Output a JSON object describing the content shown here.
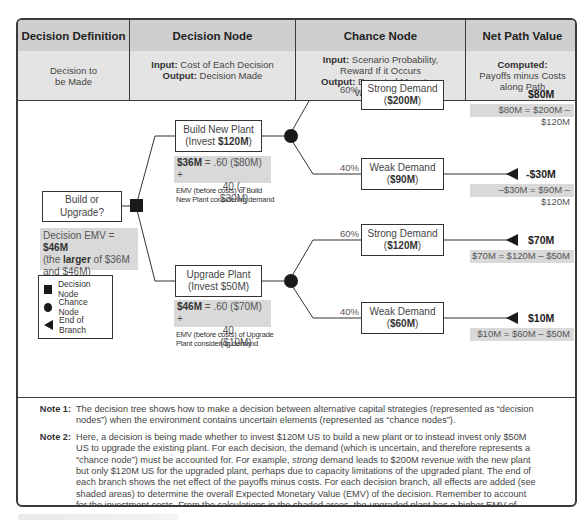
{
  "header": {
    "columns": [
      {
        "title": "Decision Definition",
        "desc_line1": "Decision to",
        "desc_line2": "be Made"
      },
      {
        "title": "Decision Node",
        "input_label": "Input:",
        "input_text": " Cost of Each Decision",
        "output_label": "Output:",
        "output_text": " Decision Made"
      },
      {
        "title": "Chance Node",
        "input_label": "Input:",
        "input_text": " Scenario Probability,",
        "input_text2": "Reward If it Occurs",
        "output_label": "Output:",
        "output_text": " Expected Monetary",
        "output_text2": "Value (EMV)"
      },
      {
        "title": "Net Path Value",
        "computed_label": "Computed:",
        "computed_text1": "Payoffs minus Costs",
        "computed_text2": "along Path"
      }
    ]
  },
  "tree": {
    "root": {
      "label": "Build or Upgrade?",
      "emv_prefix": "Decision EMV = ",
      "emv_value": "$46M",
      "emv_line2_pre": "(the ",
      "emv_line2_bold": "larger",
      "emv_line2_post": " of $36M",
      "emv_line3": "and $46M)"
    },
    "branches": [
      {
        "label_line1": "Build New Plant",
        "label_line2_pre": "(Invest ",
        "label_line2_bold": "$120M",
        "label_line2_post": ")",
        "emv_bold": "$36M",
        "emv_eq1": " = .60 ($80M) +",
        "emv_eq2": ".40 (–$30M)",
        "emv_note1": "EMV (before costs) of Build",
        "emv_note2": "New Plant considering demand",
        "outcomes": [
          {
            "probability": "60%",
            "label": "Strong Demand",
            "value": "$200M",
            "net": "$80M",
            "calc": "$80M = $200M – $120M"
          },
          {
            "probability": "40%",
            "label": "Weak Demand",
            "value": "$90M",
            "net": "-$30M",
            "calc": "–$30M = $90M – $120M"
          }
        ]
      },
      {
        "label_line1": "Upgrade Plant",
        "label_line2_pre": "(Invest $50M)",
        "label_line2_bold": "",
        "label_line2_post": "",
        "emv_bold": "$46M",
        "emv_eq1": " = .60 ($70M) +",
        "emv_eq2": ".40 ($10M)",
        "emv_note1": "EMV (before costs) of Upgrade",
        "emv_note2": "Plant considering demand",
        "outcomes": [
          {
            "probability": "60%",
            "label": "Strong Demand",
            "value": "$120M",
            "net": "$70M",
            "calc": "$70M = $120M – $50M"
          },
          {
            "probability": "40%",
            "label": "Weak Demand",
            "value": "$60M",
            "net": "$10M",
            "calc": "$10M = $60M – $50M"
          }
        ]
      }
    ]
  },
  "legend": {
    "items": [
      {
        "icon": "square-icon",
        "label": "Decision Node"
      },
      {
        "icon": "circle-icon",
        "label": "Chance Node"
      },
      {
        "icon": "triangle-left-icon",
        "label": "End of Branch"
      }
    ]
  },
  "notes": [
    {
      "label": "Note 1:",
      "text": "The decision tree shows how to make a decision between alternative capital strategies (represented as “decision nodes”) when the environment contains uncertain elements (represented as “chance nodes”)."
    },
    {
      "label": "Note 2:",
      "text_pre": "Here, a decision is being made whether to invest $120M US to build a new plant or to instead invest only $50M US to upgrade the existing plant. For each decision, the demand (which is uncertain, and therefore represents a “chance node”) must be accounted for. For example, ",
      "text_em": "strong",
      "text_post": " demand leads to $200M revenue with the new plant but only $120M US for the upgraded plant, perhaps due to capacity limitations of the upgraded plant. The end of each branch shows the net effect of the payoffs minus costs. For each decision branch, all effects are added (see shaded areas) to determine the overall Expected Monetary Value (EMV) of the decision. Remember to account for the investment costs. From the calculations in the shaded areas, the upgraded plant has a higher EMV of $46M – also the EMV of the overall decision. (This choice also represents the lowest risk, avoiding the worst case possible outcome of a loss of $30M)."
    }
  ],
  "colors": {
    "header_bg": "#cfcfcf",
    "subheader_bg": "#e4e4e4",
    "shade_bg": "#d9d9d9",
    "node_fill": "#1a1a1a",
    "border": "#3a3a3a"
  }
}
